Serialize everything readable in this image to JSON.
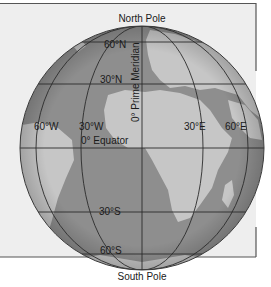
{
  "diagram": {
    "type": "globe-graticule",
    "poles": {
      "north": "North Pole",
      "south": "South Pole"
    },
    "lines": {
      "prime_meridian": "0° Prime Meridian",
      "equator": "0° Equator"
    },
    "latitudes": [
      "60°N",
      "30°N",
      "30°S",
      "60°S"
    ],
    "longitudes": [
      "60°W",
      "30°W",
      "30°E",
      "60°E"
    ],
    "colors": {
      "background": "#efefef",
      "frame": "#555555",
      "ocean": "#8c8c8c",
      "land": "#c4c4c4",
      "grid": "#2b2b2b"
    }
  }
}
